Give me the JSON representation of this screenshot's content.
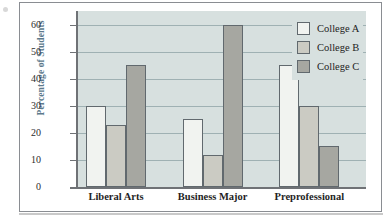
{
  "figure": {
    "y_axis_title": "Percentage of Students"
  },
  "chart_data": {
    "type": "bar",
    "title": "",
    "subtitle": "",
    "xlabel": "",
    "ylabel": "Percentage of Students",
    "ylim": [
      0,
      65
    ],
    "yticks": [
      0,
      10,
      20,
      30,
      40,
      50,
      60
    ],
    "ytick_labels": [
      "0",
      "10",
      "20",
      "30",
      "40",
      "50",
      "60"
    ],
    "grid": true,
    "grid_axis": "y",
    "legend_position": "top-right",
    "categories": [
      "Liberal Arts",
      "Business Major",
      "Preprofessional"
    ],
    "series": [
      {
        "name": "College A",
        "color": "#f1f3f0",
        "values": [
          30,
          25,
          45
        ]
      },
      {
        "name": "College B",
        "color": "#cbcbc3",
        "values": [
          23,
          12,
          30
        ]
      },
      {
        "name": "College C",
        "color": "#a6a7a1",
        "values": [
          45,
          60,
          15
        ]
      }
    ],
    "annotations": []
  },
  "legend": {
    "items": [
      {
        "label": "College A",
        "color": "#f1f3f0"
      },
      {
        "label": "College B",
        "color": "#cbcbc3"
      },
      {
        "label": "College C",
        "color": "#a6a7a1"
      }
    ]
  },
  "colors": {
    "plot_background": "#d7e0df",
    "gridline": "#9fb1b3",
    "axis": "#6f7276",
    "bar_outline": "#61696e",
    "y_title": "#5d7a8c",
    "frame": "#8a8d92"
  }
}
